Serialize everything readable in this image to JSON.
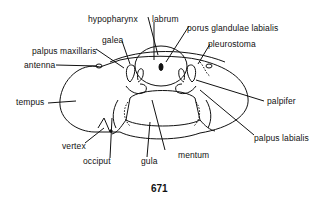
{
  "figure": {
    "number": "671"
  },
  "labels": {
    "hypopharynx": "hypopharynx",
    "labrum": "labrum",
    "porus": "porus glandulae labialis",
    "galea": "galea",
    "palpus_maxillaris": "palpus maxillaris",
    "pleurostoma": "pleurostoma",
    "antenna": "antenna",
    "tempus": "tempus",
    "palpifer": "palpifer",
    "palpus_labialis": "palpus labialis",
    "vertex": "vertex",
    "occiput": "occiput",
    "mentum": "mentum",
    "gula": "gula"
  },
  "colors": {
    "ink": "#111111",
    "background": "#ffffff"
  }
}
